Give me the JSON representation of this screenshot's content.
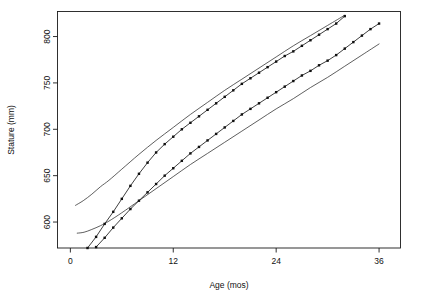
{
  "chart_data": {
    "type": "line",
    "title": "",
    "xlabel": "Age (mos)",
    "ylabel": "Stature (mm)",
    "xlim": [
      -1.5,
      38.5
    ],
    "ylim": [
      572,
      827
    ],
    "grid": false,
    "legend": "none",
    "xticks": [
      0,
      12,
      24,
      36
    ],
    "yticks": [
      600,
      650,
      700,
      750,
      800
    ],
    "xtick_labels": [
      "0",
      "12",
      "24",
      "36"
    ],
    "ytick_labels": [
      "600",
      "650",
      "700",
      "750",
      "800"
    ],
    "series": [
      {
        "name": "subject-upper",
        "style": "line-with-points",
        "marker": "filled-square",
        "x": [
          2,
          3,
          4,
          5,
          6,
          7,
          8,
          9,
          10,
          11,
          12,
          13,
          14,
          15,
          16,
          17,
          18,
          19,
          20,
          21,
          22,
          23,
          24,
          25,
          26,
          27,
          28,
          29,
          30,
          31,
          32
        ],
        "y": [
          572,
          584,
          598,
          611,
          625,
          639,
          652,
          664,
          675,
          684,
          692,
          700,
          707,
          714,
          721,
          728,
          735,
          742,
          749,
          755,
          761,
          767,
          773,
          779,
          784,
          790,
          796,
          802,
          808,
          814,
          822
        ]
      },
      {
        "name": "subject-lower",
        "style": "line-with-points",
        "marker": "filled-square",
        "x": [
          3,
          4,
          5,
          6,
          7,
          8,
          9,
          10,
          11,
          12,
          13,
          14,
          15,
          16,
          17,
          18,
          19,
          20,
          21,
          22,
          23,
          24,
          25,
          26,
          27,
          28,
          29,
          30,
          31,
          32,
          33,
          34,
          35,
          36
        ],
        "y": [
          573,
          583,
          594,
          604,
          614,
          623,
          632,
          641,
          650,
          658,
          666,
          674,
          681,
          688,
          695,
          702,
          709,
          716,
          722,
          728,
          734,
          740,
          746,
          752,
          758,
          763,
          769,
          774,
          780,
          787,
          794,
          801,
          808,
          814
        ]
      },
      {
        "name": "reference-upper",
        "style": "smooth-curve",
        "marker": "none",
        "x": [
          0.6,
          1.5,
          2.5,
          3.5,
          4.5,
          6,
          8,
          10,
          12,
          14,
          16,
          18,
          20,
          22,
          24,
          26,
          28,
          30,
          32
        ],
        "y": [
          618,
          623,
          630,
          638,
          645,
          657,
          673,
          688,
          702,
          716,
          729,
          742,
          754,
          766,
          778,
          790,
          801,
          812,
          823
        ]
      },
      {
        "name": "reference-lower",
        "style": "smooth-curve",
        "marker": "none",
        "x": [
          0.8,
          1.6,
          2.5,
          3.5,
          4.5,
          6,
          8,
          10,
          12,
          14,
          16,
          18,
          20,
          22,
          24,
          26,
          28,
          30,
          32,
          34,
          36
        ],
        "y": [
          588,
          589,
          592,
          596,
          601,
          610,
          623,
          636,
          649,
          662,
          674,
          686,
          698,
          710,
          722,
          733,
          745,
          756,
          768,
          780,
          792
        ]
      }
    ]
  },
  "figure": {
    "background_color": "#ffffff",
    "foreground_color": "#1a1a1a"
  }
}
